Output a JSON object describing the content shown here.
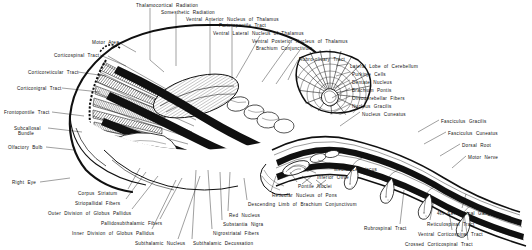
{
  "figure": {
    "ink_color": "#101010",
    "background_color": "#ffffff",
    "width": 532,
    "height": 250
  },
  "labels": {
    "top": [
      {
        "id": "thalamocortical-radiation",
        "text": "Thalamocortical   Radiation",
        "x": 136,
        "y": 3,
        "align": "left"
      },
      {
        "id": "somesthetic-radiation",
        "text": "Somesthetic   Radiation",
        "x": 161,
        "y": 10,
        "align": "left"
      },
      {
        "id": "ventral-anterior-nucleus-of-thalamus",
        "text": "Ventral   Anterior   Nucleus  of  Thalamus",
        "x": 186,
        "y": 17,
        "align": "left"
      },
      {
        "id": "parietopontile-tract",
        "text": "Parietopontile   Tract",
        "x": 219,
        "y": 23,
        "align": "left"
      },
      {
        "id": "ventral-lateral-nucleus-of-thalamus",
        "text": "Ventral  Lateral  Nucleus  of  Thalamus",
        "x": 213,
        "y": 31,
        "align": "left"
      },
      {
        "id": "ventral-posterior-nucleus-of-thalamus",
        "text": "Ventral  Posterior  Nucleus  of  Thalamus",
        "x": 252,
        "y": 39,
        "align": "left"
      },
      {
        "id": "brachium-conjunctivum",
        "text": "Brachium  Conjunctivum",
        "x": 256,
        "y": 46,
        "align": "left"
      },
      {
        "id": "rubro-olivary-tract",
        "text": "Rubro-olivary   Tract",
        "x": 299,
        "y": 57,
        "align": "left"
      }
    ],
    "left": [
      {
        "id": "motor-area",
        "text": "Motor  Area",
        "x": 92,
        "y": 40,
        "align": "left"
      },
      {
        "id": "corticospinal-tract-upper",
        "text": "Corticospinal   Tract",
        "x": 54,
        "y": 53,
        "align": "left"
      },
      {
        "id": "corticoreticular-tract",
        "text": "Corticoreticular   Tract",
        "x": 28,
        "y": 70,
        "align": "left"
      },
      {
        "id": "corticonigral-tract",
        "text": "Corticonigral   Tract",
        "x": 17,
        "y": 86,
        "align": "left"
      },
      {
        "id": "frontopontile-tract",
        "text": "Frontopontile   Tract",
        "x": 4,
        "y": 110,
        "align": "left"
      },
      {
        "id": "subcallosal-bundle-line1",
        "text": "Subcallosal",
        "x": 14,
        "y": 126,
        "align": "left"
      },
      {
        "id": "subcallosal-bundle-line2",
        "text": "Bundle",
        "x": 18,
        "y": 131,
        "align": "left"
      },
      {
        "id": "olfactory-bulb",
        "text": "Olfactory   Bulb",
        "x": 8,
        "y": 145,
        "align": "left"
      },
      {
        "id": "right-eye",
        "text": "Right   Eye",
        "x": 12,
        "y": 180,
        "align": "left"
      }
    ],
    "bottom_left": [
      {
        "id": "corpus-striatum",
        "text": "Corpus   Striatum",
        "x": 78,
        "y": 191,
        "align": "left"
      },
      {
        "id": "striopallidal-fibers",
        "text": "Striopallidal   Fibers",
        "x": 75,
        "y": 201,
        "align": "left"
      },
      {
        "id": "outer-division-of-globus-pallidus",
        "text": "Outer  Division  of  Globus  Pallidus",
        "x": 48,
        "y": 211,
        "align": "left"
      },
      {
        "id": "pallidosubthalamic-fibers",
        "text": "Pallidosubthalamic   Fibers",
        "x": 101,
        "y": 221,
        "align": "left"
      },
      {
        "id": "inner-division-of-globus-pallidus",
        "text": "Inner   Division  of  Globus  Pallidus",
        "x": 72,
        "y": 231,
        "align": "left"
      },
      {
        "id": "subthalamic-nucleus",
        "text": "Subthalamic   Nucleus",
        "x": 135,
        "y": 241,
        "align": "left"
      }
    ],
    "bottom_center": [
      {
        "id": "subthalamic-decussation",
        "text": "Subthalamic   Decussation",
        "x": 193,
        "y": 241,
        "align": "left"
      },
      {
        "id": "nigrostriatal-fibers",
        "text": "Nigrostriatal   Fibers",
        "x": 213,
        "y": 231,
        "align": "left"
      },
      {
        "id": "substantia-nigra",
        "text": "Substantia   Nigra",
        "x": 223,
        "y": 222,
        "align": "left"
      },
      {
        "id": "red-nucleus",
        "text": "Red   Nucleus",
        "x": 229,
        "y": 213,
        "align": "left"
      },
      {
        "id": "descending-limb-of-brachium-conjunctivum",
        "text": "Descending  Limb  of  Brachium  Conjunctivum",
        "x": 248,
        "y": 202,
        "align": "left"
      },
      {
        "id": "reticular-nucleus-of-pons",
        "text": "Reticular  Nucleus  of  Pons",
        "x": 272,
        "y": 193,
        "align": "left"
      },
      {
        "id": "pontile-nuclei",
        "text": "Pontile   Nuclei",
        "x": 298,
        "y": 184,
        "align": "left"
      },
      {
        "id": "inferior-olive",
        "text": "Inferior   Olive",
        "x": 317,
        "y": 175,
        "align": "left"
      },
      {
        "id": "medial-lemniscus",
        "text": "Medial   Lemniscus",
        "x": 334,
        "y": 167,
        "align": "left"
      }
    ],
    "cerebellum": [
      {
        "id": "lateral-lobe-of-cerebellum",
        "text": "Lateral   Lobe  of  Cerebellum",
        "x": 350,
        "y": 64,
        "align": "left"
      },
      {
        "id": "purkinje-cells",
        "text": "Purkinje   Cells",
        "x": 352,
        "y": 72,
        "align": "left"
      },
      {
        "id": "dentate-nucleus",
        "text": "Dentate   Nucleus",
        "x": 352,
        "y": 80,
        "align": "left"
      },
      {
        "id": "brachium-pontis",
        "text": "Brachium   Pontis",
        "x": 352,
        "y": 88,
        "align": "left"
      },
      {
        "id": "olivocerebellar-fibers",
        "text": "Olivocerebellar   Fibers",
        "x": 352,
        "y": 96,
        "align": "left"
      },
      {
        "id": "nucleus-gracilis",
        "text": "Nucleus   Gracilis",
        "x": 352,
        "y": 104,
        "align": "left"
      },
      {
        "id": "nucleus-cuneatus",
        "text": "Nucleus   Cuneatus",
        "x": 362,
        "y": 112,
        "align": "left"
      }
    ],
    "right": [
      {
        "id": "fasciculus-gracilis",
        "text": "Fasciculus   Gracilis",
        "x": 441,
        "y": 119,
        "align": "left"
      },
      {
        "id": "fasciculus-cuneatus",
        "text": "Fasciculus   Cuneatus",
        "x": 448,
        "y": 131,
        "align": "left"
      },
      {
        "id": "dorsal-root",
        "text": "Dorsal   Root",
        "x": 462,
        "y": 143,
        "align": "left"
      },
      {
        "id": "motor-nerve",
        "text": "Motor   Nerve",
        "x": 468,
        "y": 155,
        "align": "left"
      },
      {
        "id": "cervical-spinal-ganglion",
        "text": "4th  Cer.  Spinal  Ganglion",
        "x": 437,
        "y": 211,
        "align": "left"
      }
    ],
    "bottom_right": [
      {
        "id": "rubrospinal-tract",
        "text": "Rubrospinal   Tract",
        "x": 364,
        "y": 226,
        "align": "left"
      },
      {
        "id": "reticulospinal-tract",
        "text": "Reticulospinal   Tract",
        "x": 427,
        "y": 222,
        "align": "left"
      },
      {
        "id": "ventral-corticospinal-tract",
        "text": "Ventral  Corticospinal   Tract",
        "x": 418,
        "y": 232,
        "align": "left"
      },
      {
        "id": "crossed-corticospinal-tract",
        "text": "Crossed   Corticospinal   Tract",
        "x": 405,
        "y": 242,
        "align": "left"
      }
    ]
  }
}
